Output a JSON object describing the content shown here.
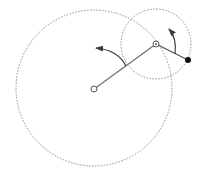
{
  "diagram": {
    "title": "",
    "colors": {
      "background": "#ffffff",
      "workspace_circle": "#8a8a8a",
      "link": "#6e6e6e",
      "arrow": "#3a3a3a",
      "joint_outline": "#555555",
      "end_effector": "#111111"
    },
    "elements": [
      {
        "name": "workspace-circle-outer",
        "kind": "dotted-circle"
      },
      {
        "name": "workspace-circle-inner",
        "kind": "dotted-circle"
      },
      {
        "name": "link-1",
        "kind": "line",
        "from": "base-joint",
        "to": "elbow-joint"
      },
      {
        "name": "link-2",
        "kind": "line",
        "from": "elbow-joint",
        "to": "end-effector"
      },
      {
        "name": "base-joint",
        "kind": "open-circle"
      },
      {
        "name": "elbow-joint",
        "kind": "open-circle-with-dot"
      },
      {
        "name": "end-effector",
        "kind": "filled-circle"
      },
      {
        "name": "rotation-arrow-1",
        "kind": "curved-arrow",
        "direction": "counterclockwise"
      },
      {
        "name": "rotation-arrow-2",
        "kind": "curved-arrow",
        "direction": "counterclockwise"
      }
    ]
  }
}
